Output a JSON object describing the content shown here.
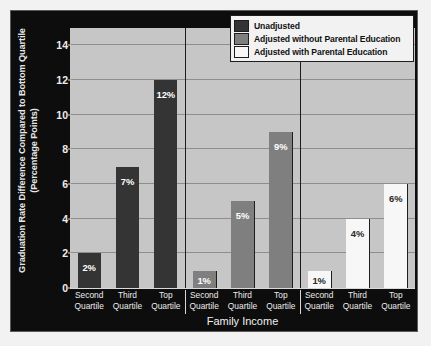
{
  "chart_data": {
    "type": "bar",
    "title": "",
    "subtitle": "",
    "xlabel": "Family Income",
    "ylabel": "Graduation Rate Difference Compared to Bottom Quartile (Percentage Points)",
    "ylabel_line1": "Graduation Rate Difference Compared to Bottom Quartile",
    "ylabel_line2": "(Percentage Points)",
    "categories": [
      "Second Quartile",
      "Third Quartile",
      "Top Quartile"
    ],
    "category_lines": [
      {
        "l1": "Second",
        "l2": "Quartile"
      },
      {
        "l1": "Third",
        "l2": "Quartile"
      },
      {
        "l1": "Top",
        "l2": "Quartile"
      }
    ],
    "series": [
      {
        "name": "Unadjusted",
        "color": "#343434",
        "values": [
          2,
          7,
          12
        ],
        "labels": [
          "2%",
          "7%",
          "12%"
        ]
      },
      {
        "name": "Adjusted without Parental Education",
        "color": "#7f7f7f",
        "values": [
          1,
          5,
          9
        ],
        "labels": [
          "1%",
          "5%",
          "9%"
        ]
      },
      {
        "name": "Adjusted with Parental Education",
        "color": "#f7f7f7",
        "values": [
          1,
          4,
          6
        ],
        "labels": [
          "1%",
          "4%",
          "6%"
        ]
      }
    ],
    "ylim": [
      0,
      15
    ],
    "yticks": [
      0,
      2,
      4,
      6,
      8,
      10,
      12,
      14
    ],
    "ytick_labels": [
      "0",
      "2",
      "4",
      "6",
      "8",
      "10",
      "12",
      "14"
    ],
    "grid": true,
    "grid_axis": "y",
    "legend_position": "top-right",
    "group_separators": true,
    "plot_background": "#c6c6c6",
    "figure_background": "#0d0d0d"
  },
  "legend": {
    "entries": [
      {
        "label": "Unadjusted",
        "swatch": "#343434"
      },
      {
        "label": "Adjusted without Parental Education",
        "swatch": "#7f7f7f"
      },
      {
        "label": "Adjusted with Parental Education",
        "swatch": "#f7f7f7"
      }
    ]
  }
}
